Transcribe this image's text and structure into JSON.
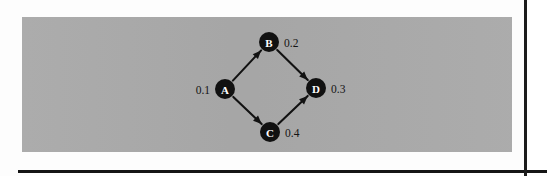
{
  "figure": {
    "kind": "directed-graph-diagram",
    "panel_color": "#a9a9a9",
    "node_color": "#111111",
    "node_label_color": "#ffffff",
    "edge_color": "#121212",
    "weight_label_color": "#141414",
    "nodes": [
      {
        "id": "A",
        "label": "A",
        "weight": "0.1",
        "weight_side": "left",
        "cx": 225,
        "cy": 89,
        "r": 10
      },
      {
        "id": "B",
        "label": "B",
        "weight": "0.2",
        "weight_side": "right",
        "cx": 269,
        "cy": 42,
        "r": 10
      },
      {
        "id": "C",
        "label": "C",
        "weight": "0.4",
        "weight_side": "right",
        "cx": 270,
        "cy": 132,
        "r": 10
      },
      {
        "id": "D",
        "label": "D",
        "weight": "0.3",
        "weight_side": "right",
        "cx": 316,
        "cy": 88,
        "r": 10
      }
    ],
    "edges": [
      {
        "id": "A-B",
        "from": "A",
        "to": "B",
        "directed": true
      },
      {
        "id": "A-C",
        "from": "A",
        "to": "C",
        "directed": true
      },
      {
        "id": "B-D",
        "from": "B",
        "to": "D",
        "directed": true
      },
      {
        "id": "C-D",
        "from": "C",
        "to": "D",
        "directed": true
      }
    ]
  }
}
